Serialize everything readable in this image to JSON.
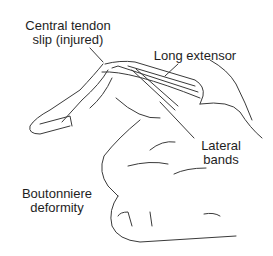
{
  "diagram": {
    "labels": {
      "central_tendon_line1": "Central tendon",
      "central_tendon_line2": "slip (injured)",
      "long_extensor": "Long extensor",
      "lateral_bands_line1": "Lateral",
      "lateral_bands_line2": "bands",
      "boutonniere_line1": "Boutonniere",
      "boutonniere_line2": "deformity"
    },
    "colors": {
      "line": "#3a3a3a",
      "background": "#ffffff",
      "text": "#1e1e1e"
    }
  }
}
